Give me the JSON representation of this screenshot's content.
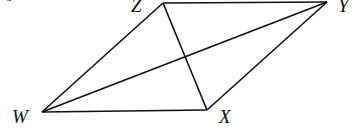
{
  "figure": {
    "caption_fragment": "igure",
    "vertices": [
      {
        "name": "Z",
        "x": 163,
        "y": 3,
        "label_x": 132,
        "label_y": 12
      },
      {
        "name": "Y",
        "x": 327,
        "y": 2,
        "label_x": 338,
        "label_y": 12
      },
      {
        "name": "W",
        "x": 42,
        "y": 112,
        "label_x": 13,
        "label_y": 123
      },
      {
        "name": "X",
        "x": 207,
        "y": 110,
        "label_x": 219,
        "label_y": 123
      }
    ],
    "segments": [
      [
        "Z",
        "Y"
      ],
      [
        "Y",
        "X"
      ],
      [
        "X",
        "W"
      ],
      [
        "W",
        "Z"
      ],
      [
        "W",
        "Y"
      ],
      [
        "Z",
        "X"
      ]
    ],
    "labels": {
      "Z": "Z",
      "Y": "Y",
      "W": "W",
      "X": "X"
    }
  }
}
